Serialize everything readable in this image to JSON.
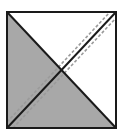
{
  "figure": {
    "name": "quilt-block-half-square-triangle-diagram",
    "canvas": {
      "width": 123,
      "height": 138,
      "background": "#ffffff"
    },
    "block": {
      "name": "square-block",
      "left": 7,
      "top": 12,
      "right": 116,
      "bottom": 128,
      "border_color": "#1a1a1a",
      "border_width": 2,
      "fill": "#ffffff"
    },
    "colors": {
      "fabric_shaded": "#a8a8a8",
      "fabric_light": "#ffffff",
      "seam_line": "#1a1a1a",
      "stitch_guide": "#9a9a9a",
      "outline": "#1a1a1a"
    },
    "regions": [
      {
        "name": "triangle-top",
        "position": "top",
        "fill": "fabric_light",
        "label": "light"
      },
      {
        "name": "triangle-right",
        "position": "right",
        "fill": "fabric_light",
        "label": "light"
      },
      {
        "name": "triangle-left",
        "position": "left",
        "fill": "fabric_shaded",
        "label": "shaded"
      },
      {
        "name": "triangle-bottom",
        "position": "bottom",
        "fill": "fabric_shaded",
        "label": "shaded"
      }
    ],
    "lines": [
      {
        "name": "diagonal-bottomleft-topright",
        "style": "solid",
        "color": "#1a1a1a",
        "width": 2,
        "from": "bottom-left-corner",
        "to": "top-right-corner"
      },
      {
        "name": "diagonal-topleft-bottomright",
        "style": "solid",
        "color": "#1a1a1a",
        "width": 2,
        "from": "top-left-corner",
        "to": "bottom-right-corner"
      },
      {
        "name": "stitch-guide-upper",
        "style": "dashed",
        "color": "#9a9a9a",
        "width": 1.6,
        "dash": "3 2",
        "offset": 6,
        "side": "upper-left"
      },
      {
        "name": "stitch-guide-lower",
        "style": "dashed",
        "color": "#9a9a9a",
        "width": 1.6,
        "dash": "3 2",
        "offset": -6,
        "side": "lower-right"
      }
    ]
  }
}
